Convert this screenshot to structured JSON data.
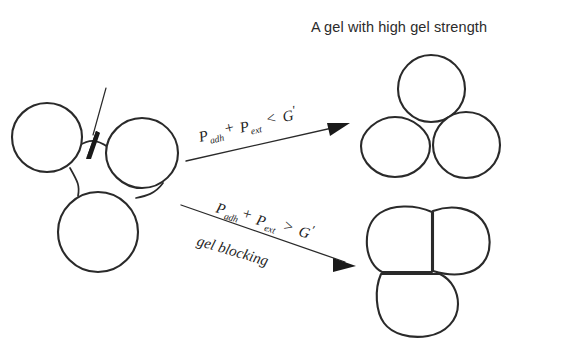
{
  "figure": {
    "title": "A gel with high gel strength",
    "background_color": "#ffffff",
    "ink_color": "#2a2a2a"
  },
  "branches": {
    "upper": {
      "condition_lhs_1": "P",
      "condition_sub_1": "adh",
      "condition_plus": "+",
      "condition_lhs_2": "P",
      "condition_sub_2": "ext",
      "condition_relation": "<",
      "condition_rhs": "G",
      "condition_rhs_prime": "′",
      "condition_full": "P adh + P ext < G′",
      "outcome_label": "A gel with high gel strength"
    },
    "lower": {
      "condition_lhs_1": "P",
      "condition_sub_1": "adh",
      "condition_plus": "+",
      "condition_lhs_2": "P",
      "condition_sub_2": "ext",
      "condition_relation": ">",
      "condition_rhs": "G",
      "condition_rhs_prime": "′",
      "condition_full": "P adh + P ext > G′",
      "outcome_label": "gel blocking"
    }
  },
  "clusters": {
    "source": {
      "name": "connected gel particle cluster",
      "particle_count": 3,
      "connector_count": 3,
      "annotation": "arrow pointing to inter-particle neck"
    },
    "upper_result": {
      "name": "three discrete spherical gel particles",
      "particle_count": 3
    },
    "lower_result": {
      "name": "three deformed coalesced gel blobs",
      "particle_count": 3
    }
  },
  "icons": {
    "pointer": "arrow-pointer-icon",
    "transition_upper": "right-arrow-icon",
    "transition_lower": "right-arrow-icon"
  }
}
